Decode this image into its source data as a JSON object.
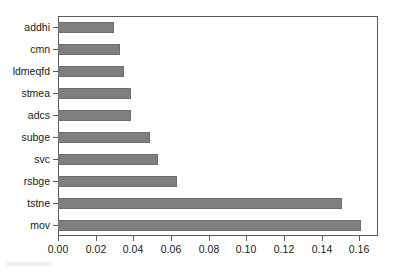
{
  "chart_data": {
    "type": "bar",
    "orientation": "horizontal",
    "title": "",
    "subtitle": "",
    "xlabel": "",
    "ylabel": "",
    "categories": [
      "addhi",
      "cmn",
      "ldmeqfd",
      "stmea",
      "adcs",
      "subge",
      "svc",
      "rsbge",
      "tstne",
      "mov"
    ],
    "values": [
      0.03,
      0.033,
      0.035,
      0.039,
      0.039,
      0.049,
      0.053,
      0.063,
      0.151,
      0.161
    ],
    "xlim": [
      0.0,
      0.17
    ],
    "xticks": [
      0.0,
      0.02,
      0.04,
      0.06,
      0.08,
      0.1,
      0.12,
      0.14,
      0.16
    ],
    "xtick_labels": [
      "0.00",
      "0.02",
      "0.04",
      "0.06",
      "0.08",
      "0.10",
      "0.12",
      "0.14",
      "0.16"
    ],
    "grid": false,
    "legend": null,
    "bar_color": "#7f7f7f",
    "bar_edge_color": "#6e6e6e",
    "axis_color": "#5a5a5a",
    "background_color": "#ffffff"
  }
}
